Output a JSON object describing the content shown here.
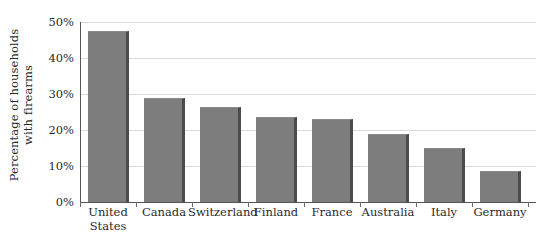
{
  "chart_data": {
    "type": "bar",
    "title": "",
    "xlabel": "",
    "ylabel": "Percentage of households with firearms",
    "ylabel_lines": [
      "Percentage of households",
      "with firearms"
    ],
    "categories": [
      "United States",
      "Canada",
      "Switzerland",
      "Finland",
      "France",
      "Australia",
      "Italy",
      "Germany"
    ],
    "category_lines": [
      [
        "United",
        "States"
      ],
      [
        "Canada"
      ],
      [
        "Switzerland"
      ],
      [
        "Finland"
      ],
      [
        "France"
      ],
      [
        "Australia"
      ],
      [
        "Italy"
      ],
      [
        "Germany"
      ]
    ],
    "values": [
      47.5,
      29.0,
      26.5,
      23.5,
      23.0,
      19.0,
      15.0,
      8.5
    ],
    "value_unit": "%",
    "ylim": [
      0,
      50
    ],
    "ytick_values": [
      0,
      10,
      20,
      30,
      40,
      50
    ],
    "ytick_labels": [
      "0%",
      "10%",
      "20%",
      "30%",
      "40%",
      "50%"
    ],
    "grid": true,
    "grid_axis": "y",
    "legend": false,
    "legend_position": "none",
    "orientation": "vertical",
    "colors": {
      "bar_face": "#7d7d7d",
      "bar_shadow": "#4b4b4b",
      "gridline": "#d9d9d9",
      "axis": "#555555",
      "background": "#ffffff",
      "text": "#2a2a2a"
    }
  }
}
